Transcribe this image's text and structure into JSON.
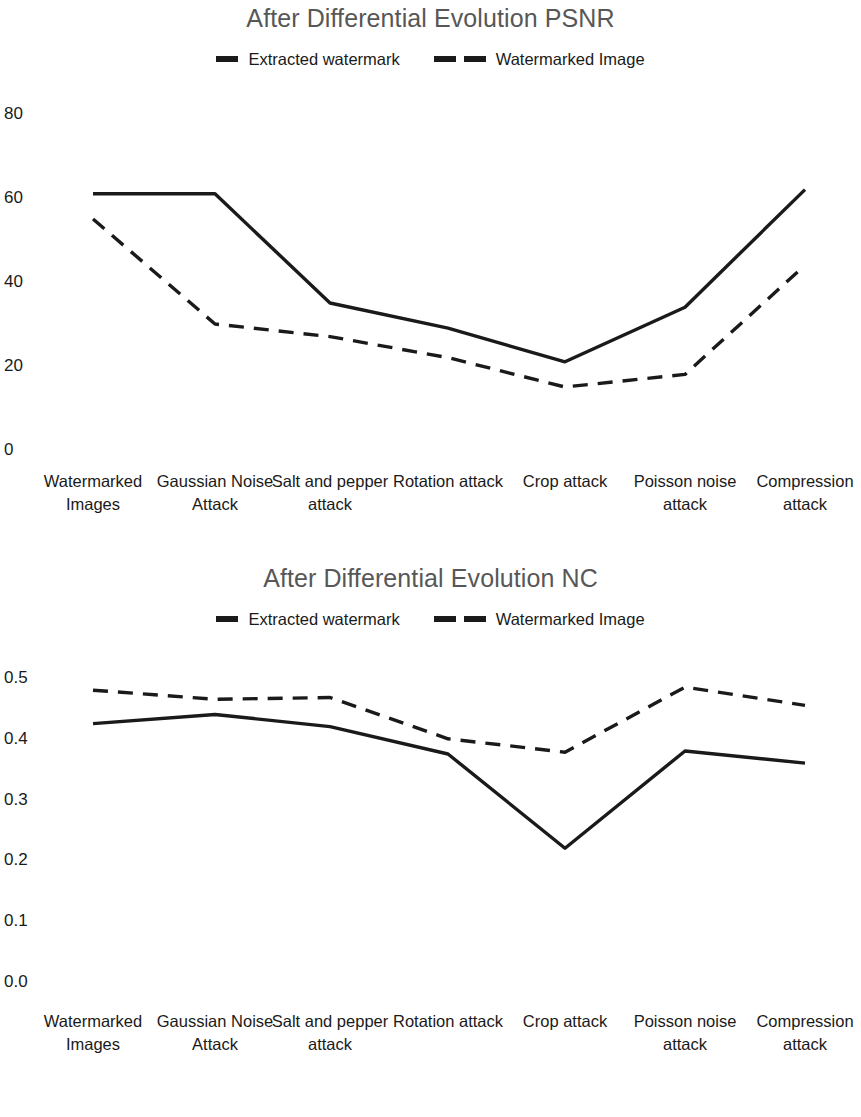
{
  "figures": [
    {
      "id": "psnr",
      "title": "After Differential Evolution PSNR",
      "legend": [
        {
          "label": "Extracted watermark",
          "style": "solid"
        },
        {
          "label": "Watermarked Image",
          "style": "dashed"
        }
      ]
    },
    {
      "id": "nc",
      "title": "After Differential Evolution NC",
      "legend": [
        {
          "label": "Extracted watermark",
          "style": "solid"
        },
        {
          "label": "Watermarked Image",
          "style": "dashed"
        }
      ]
    }
  ],
  "chart_data": [
    {
      "type": "line",
      "title": "After Differential Evolution PSNR",
      "xlabel": "",
      "ylabel": "",
      "ylim": [
        0,
        80
      ],
      "yticks": [
        "0",
        "20",
        "40",
        "60",
        "80"
      ],
      "grid": false,
      "legend_position": "top-center",
      "categories": [
        "Watermarked Images",
        "Gaussian Noise Attack",
        "Salt and pepper attack",
        "Rotation attack",
        "Crop attack",
        "Poisson noise attack",
        "Compression attack"
      ],
      "series": [
        {
          "name": "Extracted watermark",
          "style": "solid",
          "color": "#1a1a1a",
          "values": [
            61,
            61,
            35,
            29,
            21,
            34,
            62
          ]
        },
        {
          "name": "Watermarked Image",
          "style": "dashed",
          "color": "#1a1a1a",
          "values": [
            55,
            30,
            27,
            22,
            15,
            18,
            44
          ]
        }
      ]
    },
    {
      "type": "line",
      "title": "After Differential Evolution NC",
      "xlabel": "",
      "ylabel": "",
      "ylim": [
        0.0,
        0.5
      ],
      "yticks": [
        "0.0",
        "0.1",
        "0.2",
        "0.3",
        "0.4",
        "0.5"
      ],
      "grid": false,
      "legend_position": "top-center",
      "categories": [
        "Watermarked Images",
        "Gaussian Noise Attack",
        "Salt and pepper attack",
        "Rotation attack",
        "Crop attack",
        "Poisson noise attack",
        "Compression attack"
      ],
      "series": [
        {
          "name": "Extracted watermark",
          "style": "solid",
          "color": "#1a1a1a",
          "values": [
            0.425,
            0.44,
            0.42,
            0.375,
            0.22,
            0.38,
            0.36
          ]
        },
        {
          "name": "Watermarked Image",
          "style": "dashed",
          "color": "#1a1a1a",
          "values": [
            0.48,
            0.465,
            0.468,
            0.4,
            0.378,
            0.485,
            0.455
          ]
        }
      ]
    }
  ]
}
